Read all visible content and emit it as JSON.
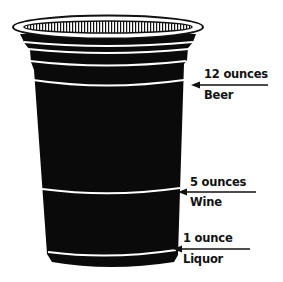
{
  "diagram": {
    "cup_color": "#0a0a0a",
    "stripe_color": "#ffffff",
    "text_color": "#111111",
    "markers": [
      {
        "amount": "12 ounces",
        "drink": "Beer"
      },
      {
        "amount": "5 ounces",
        "drink": "Wine"
      },
      {
        "amount": "1 ounce",
        "drink": "Liquor"
      }
    ]
  }
}
